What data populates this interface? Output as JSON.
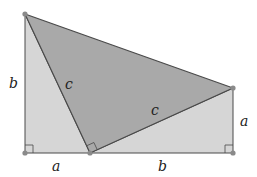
{
  "diagram": {
    "colors": {
      "light_fill": "#d6d6d6",
      "dark_fill": "#a9a9a9",
      "stroke": "#4a4a4a",
      "vertex": "#8a8a8a"
    },
    "vertices": {
      "top_left": [
        25,
        14
      ],
      "bottom_left": [
        25,
        153
      ],
      "bottom_mid": [
        90,
        153
      ],
      "bottom_right": [
        233,
        153
      ],
      "right_top": [
        233,
        88
      ]
    },
    "labels": {
      "left_side": "b",
      "bottom_left_side": "a",
      "bottom_right_side": "b",
      "right_side": "a",
      "hyp_left": "c",
      "hyp_right": "c"
    }
  }
}
